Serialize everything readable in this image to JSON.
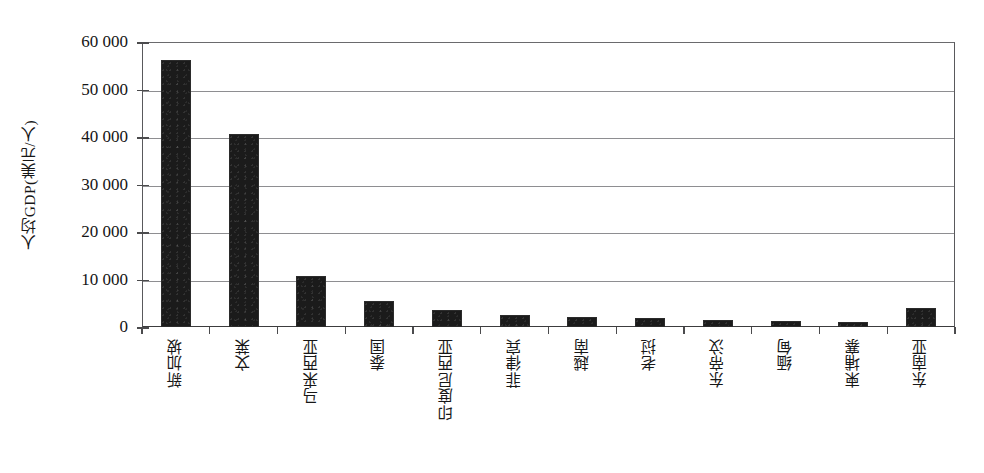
{
  "chart_data": {
    "type": "bar",
    "title": "",
    "subtitle": "",
    "xlabel": "",
    "ylabel": "人均GDP(美元/人)",
    "ylim": [
      0,
      60000
    ],
    "grid": true,
    "legend": "none",
    "y_ticks": [
      0,
      10000,
      20000,
      30000,
      40000,
      50000,
      60000
    ],
    "y_tick_labels": [
      "0",
      "10 000",
      "20 000",
      "30 000",
      "40 000",
      "50 000",
      "60 000"
    ],
    "categories": [
      "新加坡",
      "文莱",
      "马来西亚",
      "泰国",
      "印度尼西亚",
      "菲律宾",
      "越南",
      "老挝",
      "东帝汶",
      "缅甸",
      "柬埔寨",
      "东南亚"
    ],
    "values": [
      56200,
      40700,
      10700,
      5470,
      3570,
      2530,
      2090,
      1860,
      1470,
      1260,
      1000,
      3960
    ],
    "bar_color": "#1b1b1b",
    "axis_color": "#59595c",
    "grid_color": "#8e8e91"
  }
}
